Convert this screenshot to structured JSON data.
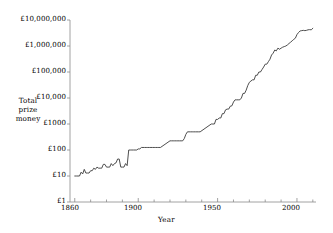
{
  "chart_data": {
    "type": "line",
    "title": "",
    "subtitle": "",
    "xlabel": "Year",
    "ylabel": "Total prize money",
    "ylabel_lines": [
      "Total",
      "prize",
      "money"
    ],
    "yscale": "log",
    "xscale": "linear",
    "xlim": [
      1857,
      2012
    ],
    "ylim": [
      1,
      10000000
    ],
    "grid": false,
    "legend": null,
    "line_color": "#3a3a3a",
    "axis_color": "#8a8a8a",
    "background": "#ffffff",
    "xticks": [
      1860,
      1900,
      1950,
      2000
    ],
    "xtick_labels": [
      "1860",
      "1900",
      "1950",
      "2000"
    ],
    "xminor_ticks": [
      1870,
      1880,
      1890,
      1910,
      1920,
      1930,
      1940,
      1960,
      1970,
      1980,
      1990,
      2010
    ],
    "yticks": [
      1,
      10,
      100,
      1000,
      10000,
      100000,
      1000000,
      10000000
    ],
    "ytick_labels": [
      "£1",
      "£10",
      "£100",
      "£1000",
      "£10,000",
      "£100,000",
      "£1,000,000",
      "£10,000,000"
    ],
    "currency_symbol": "£",
    "series": [
      {
        "name": "Total prize money",
        "x": [
          1860,
          1861,
          1862,
          1863,
          1864,
          1865,
          1866,
          1867,
          1868,
          1869,
          1870,
          1871,
          1872,
          1873,
          1874,
          1875,
          1876,
          1877,
          1878,
          1879,
          1880,
          1881,
          1882,
          1883,
          1884,
          1885,
          1886,
          1887,
          1888,
          1889,
          1890,
          1891,
          1892,
          1893,
          1894,
          1895,
          1896,
          1897,
          1898,
          1899,
          1900,
          1901,
          1902,
          1903,
          1904,
          1905,
          1906,
          1907,
          1908,
          1909,
          1910,
          1911,
          1912,
          1913,
          1914,
          1920,
          1921,
          1922,
          1923,
          1924,
          1925,
          1926,
          1927,
          1928,
          1929,
          1930,
          1931,
          1932,
          1933,
          1934,
          1935,
          1936,
          1937,
          1938,
          1939,
          1946,
          1947,
          1948,
          1949,
          1950,
          1951,
          1952,
          1953,
          1954,
          1955,
          1956,
          1957,
          1958,
          1959,
          1960,
          1961,
          1962,
          1963,
          1964,
          1965,
          1966,
          1967,
          1968,
          1969,
          1970,
          1971,
          1972,
          1973,
          1974,
          1975,
          1976,
          1977,
          1978,
          1979,
          1980,
          1981,
          1982,
          1983,
          1984,
          1985,
          1986,
          1987,
          1988,
          1989,
          1990,
          1991,
          1992,
          1993,
          1994,
          1995,
          1996,
          1997,
          1998,
          1999,
          2000,
          2001,
          2002,
          2003,
          2004,
          2005,
          2006,
          2007,
          2008,
          2009,
          2010
        ],
        "y": [
          10,
          10,
          10,
          10,
          14,
          12,
          18,
          13,
          13,
          13,
          16,
          16,
          20,
          18,
          22,
          20,
          20,
          20,
          28,
          28,
          22,
          22,
          22,
          30,
          25,
          30,
          32,
          45,
          45,
          22,
          22,
          22,
          30,
          25,
          100,
          100,
          100,
          100,
          100,
          100,
          110,
          110,
          125,
          125,
          125,
          125,
          125,
          125,
          125,
          125,
          125,
          125,
          125,
          125,
          125,
          225,
          225,
          225,
          225,
          225,
          225,
          225,
          225,
          225,
          275,
          400,
          500,
          500,
          500,
          500,
          500,
          500,
          500,
          500,
          500,
          1000,
          1000,
          1000,
          1500,
          1500,
          1700,
          1700,
          2500,
          2500,
          3500,
          3750,
          3750,
          4850,
          5000,
          7000,
          8500,
          8500,
          8500,
          8500,
          10000,
          15000,
          15000,
          20000,
          30000,
          40000,
          45000,
          50000,
          50000,
          75000,
          75000,
          100000,
          100000,
          125000,
          155000,
          200000,
          200000,
          250000,
          310000,
          450000,
          530000,
          700000,
          650000,
          827000,
          750000,
          825000,
          900000,
          950000,
          1000000,
          1100000,
          1250000,
          1400000,
          1586000,
          1800000,
          2000000,
          2750000,
          3300000,
          3800000,
          3900000,
          4000000,
          3900000,
          4000000,
          4200000,
          4260000,
          4200000,
          4800000
        ]
      }
    ]
  },
  "axis": {
    "y_title_lines": [
      "Total",
      "prize",
      "money"
    ],
    "x_title": "Year"
  }
}
